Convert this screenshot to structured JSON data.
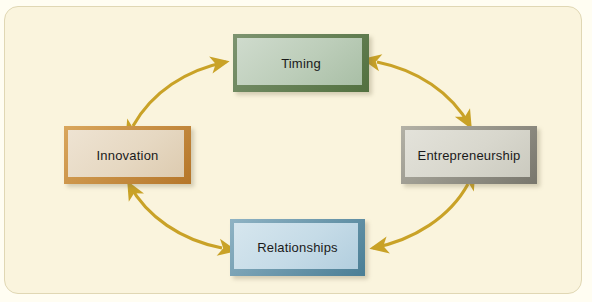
{
  "figure": {
    "background_color": "#faf4dd",
    "frame_border_color": "#e0d7b4",
    "arrow_color": "#c9a227",
    "arrow_style": "double-headed-curved"
  },
  "nodes": [
    {
      "id": "timing",
      "label": "Timing",
      "position": "top",
      "border_color": "#52703f",
      "fill_color": "#bccdb9"
    },
    {
      "id": "innovation",
      "label": "Innovation",
      "position": "left",
      "border_color": "#b5762a",
      "fill_color": "#e6d8c2"
    },
    {
      "id": "entrepreneurship",
      "label": "Entrepreneurship",
      "position": "right",
      "border_color": "#78766c",
      "fill_color": "#d8d7cd"
    },
    {
      "id": "relationships",
      "label": "Relationships",
      "position": "bottom",
      "border_color": "#4a7e95",
      "fill_color": "#c5dbe7"
    }
  ],
  "connectors": [
    {
      "id": "innovation-timing",
      "from": "Innovation",
      "to": "Timing",
      "bidirectional": true
    },
    {
      "id": "timing-entrepreneurship",
      "from": "Timing",
      "to": "Entrepreneurship",
      "bidirectional": true
    },
    {
      "id": "entrepreneurship-relationships",
      "from": "Entrepreneurship",
      "to": "Relationships",
      "bidirectional": true
    },
    {
      "id": "relationships-innovation",
      "from": "Relationships",
      "to": "Innovation",
      "bidirectional": true
    }
  ]
}
